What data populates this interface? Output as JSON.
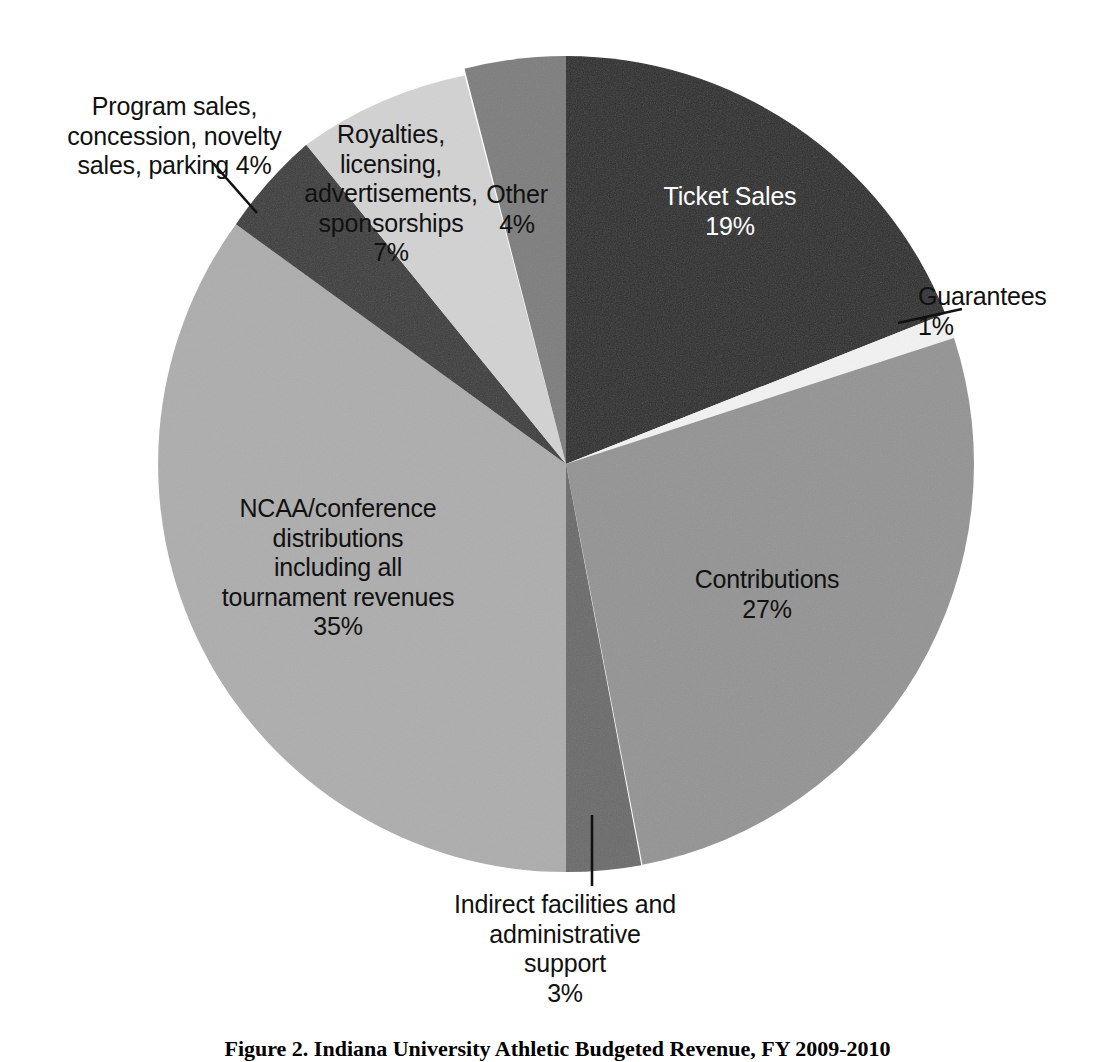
{
  "figure": {
    "caption": "Figure 2. Indiana University Athletic Budgeted Revenue, FY 2009-2010",
    "background_color": "#ffffff"
  },
  "chart_data": {
    "type": "pie",
    "title": "Indiana University Athletic Budgeted Revenue, FY 2009-2010",
    "xlabel": "",
    "ylabel": "",
    "grid": false,
    "legend_position": "none",
    "start_angle_deg": 0,
    "direction": "clockwise",
    "center_px": [
      566,
      464
    ],
    "radius_px": 408,
    "units": "percent",
    "categories": [
      "Ticket Sales",
      "Guarantees",
      "Contributions",
      "Indirect facilities and administrative support",
      "NCAA/conference distributions including all tournament revenues",
      "Program sales, concession, novelty sales, parking",
      "Royalties, licensing, advertisements, sponsorships",
      "Other"
    ],
    "values": [
      19,
      1,
      27,
      3,
      35,
      4,
      7,
      4
    ],
    "value_labels": [
      "19%",
      "1%",
      "27%",
      "3%",
      "35%",
      "4%",
      "7%",
      "4%"
    ],
    "colors": [
      "#2b2b2b",
      "#f2f2f2",
      "#949494",
      "#6b6b6b",
      "#adadad",
      "#3b3b3b",
      "#d2d2d2",
      "#7d7d7d"
    ],
    "slices": [
      {
        "name": "Ticket Sales",
        "value": 19,
        "value_label": "19%",
        "color": "#2b2b2b",
        "label_text": "Ticket Sales\n19%",
        "label_placement": "inside",
        "label_color": "#ffffff",
        "start_angle_deg": 0,
        "end_angle_deg": 68.4
      },
      {
        "name": "Guarantees",
        "value": 1,
        "value_label": "1%",
        "color": "#f2f2f2",
        "label_text": "Guarantees\n1%",
        "label_placement": "outside",
        "label_color": "#111111",
        "leader_line": true,
        "start_angle_deg": 68.4,
        "end_angle_deg": 72.0
      },
      {
        "name": "Contributions",
        "value": 27,
        "value_label": "27%",
        "color": "#949494",
        "label_text": "Contributions\n27%",
        "label_placement": "inside",
        "label_color": "#111111",
        "start_angle_deg": 72.0,
        "end_angle_deg": 169.2
      },
      {
        "name": "Indirect facilities and administrative support",
        "value": 3,
        "value_label": "3%",
        "color": "#6b6b6b",
        "label_text": "Indirect facilities and\nadministrative\nsupport\n3%",
        "label_placement": "outside",
        "label_color": "#111111",
        "leader_line": true,
        "start_angle_deg": 169.2,
        "end_angle_deg": 180.0
      },
      {
        "name": "NCAA/conference distributions including all tournament revenues",
        "value": 35,
        "value_label": "35%",
        "color": "#adadad",
        "label_text": "NCAA/conference\ndistributions\nincluding all\ntournament revenues\n35%",
        "label_placement": "inside",
        "label_color": "#111111",
        "start_angle_deg": 180.0,
        "end_angle_deg": 306.0
      },
      {
        "name": "Program sales, concession, novelty sales, parking",
        "value": 4,
        "value_label": "4%",
        "color": "#3b3b3b",
        "label_text": "Program sales,\nconcession, novelty\nsales, parking 4%",
        "label_placement": "outside",
        "label_color": "#111111",
        "leader_line": true,
        "start_angle_deg": 306.0,
        "end_angle_deg": 320.4
      },
      {
        "name": "Royalties, licensing, advertisements, sponsorships",
        "value": 7,
        "value_label": "7%",
        "color": "#d2d2d2",
        "label_text": "Royalties, licensing,\nadvertisements,\nsponsorships\n7%",
        "label_placement": "inside",
        "label_color": "#111111",
        "start_angle_deg": 320.4,
        "end_angle_deg": 345.6
      },
      {
        "name": "Other",
        "value": 4,
        "value_label": "4%",
        "color": "#7d7d7d",
        "label_text": "Other\n4%",
        "label_placement": "inside",
        "label_color": "#111111",
        "start_angle_deg": 345.6,
        "end_angle_deg": 360.0
      }
    ]
  }
}
